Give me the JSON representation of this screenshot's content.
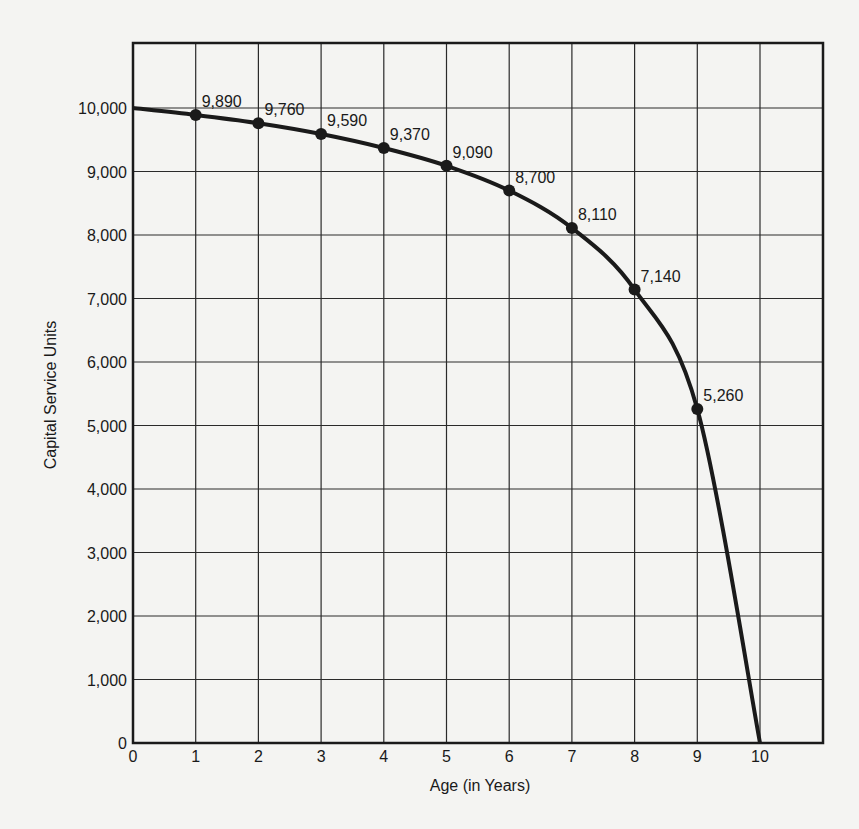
{
  "chart_data": {
    "type": "line",
    "title": "",
    "xlabel": "Age (in Years)",
    "ylabel": "Capital Service Units",
    "x": [
      0,
      1,
      2,
      3,
      4,
      5,
      6,
      7,
      8,
      9,
      10
    ],
    "values": [
      10000,
      9890,
      9760,
      9590,
      9370,
      9090,
      8700,
      8110,
      7140,
      5260,
      0
    ],
    "labeled_points": [
      {
        "x": 1,
        "y": 9890,
        "label": "9,890"
      },
      {
        "x": 2,
        "y": 9760,
        "label": "9,760"
      },
      {
        "x": 3,
        "y": 9590,
        "label": "9,590"
      },
      {
        "x": 4,
        "y": 9370,
        "label": "9,370"
      },
      {
        "x": 5,
        "y": 9090,
        "label": "9,090"
      },
      {
        "x": 6,
        "y": 8700,
        "label": "8,700"
      },
      {
        "x": 7,
        "y": 8110,
        "label": "8,110"
      },
      {
        "x": 8,
        "y": 7140,
        "label": "7,140"
      },
      {
        "x": 9,
        "y": 5260,
        "label": "5,260"
      }
    ],
    "x_ticks": [
      "0",
      "1",
      "2",
      "3",
      "4",
      "5",
      "6",
      "7",
      "8",
      "9",
      "10"
    ],
    "y_ticks": [
      "0",
      "1,000",
      "2,000",
      "3,000",
      "4,000",
      "5,000",
      "6,000",
      "7,000",
      "8,000",
      "9,000",
      "10,000"
    ],
    "xlim": [
      0,
      11
    ],
    "ylim": [
      0,
      11000
    ],
    "grid": true,
    "legend": null
  }
}
